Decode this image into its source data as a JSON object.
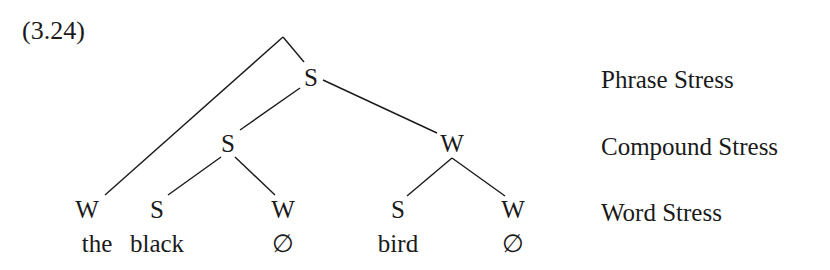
{
  "example_number": "(3.24)",
  "tree": {
    "nodes": [
      {
        "id": "apex",
        "label": "",
        "x": 283,
        "y": 37
      },
      {
        "id": "phrase-s",
        "label": "S",
        "x": 311,
        "y": 77
      },
      {
        "id": "compound-s",
        "label": "S",
        "x": 228,
        "y": 143
      },
      {
        "id": "compound-w",
        "label": "W",
        "x": 452,
        "y": 143
      },
      {
        "id": "word-w-the",
        "label": "W",
        "x": 87,
        "y": 209
      },
      {
        "id": "word-s-black",
        "label": "S",
        "x": 157,
        "y": 209
      },
      {
        "id": "word-w-null1",
        "label": "W",
        "x": 283,
        "y": 209
      },
      {
        "id": "word-s-bird",
        "label": "S",
        "x": 398,
        "y": 209
      },
      {
        "id": "word-w-null2",
        "label": "W",
        "x": 513,
        "y": 209
      }
    ],
    "edges": [
      {
        "x1": 283,
        "y1": 37,
        "x2": 105,
        "y2": 195
      },
      {
        "x1": 283,
        "y1": 37,
        "x2": 304,
        "y2": 62
      },
      {
        "x1": 300,
        "y1": 88,
        "x2": 240,
        "y2": 130
      },
      {
        "x1": 323,
        "y1": 80,
        "x2": 437,
        "y2": 133
      },
      {
        "x1": 221,
        "y1": 157,
        "x2": 168,
        "y2": 195
      },
      {
        "x1": 235,
        "y1": 157,
        "x2": 275,
        "y2": 195
      },
      {
        "x1": 452,
        "y1": 158,
        "x2": 407,
        "y2": 196
      },
      {
        "x1": 452,
        "y1": 158,
        "x2": 505,
        "y2": 196
      }
    ]
  },
  "words": [
    {
      "text": "the",
      "x": 97,
      "y": 243
    },
    {
      "text": "black",
      "x": 157,
      "y": 243
    },
    {
      "text": "∅",
      "x": 283,
      "y": 243
    },
    {
      "text": "bird",
      "x": 398,
      "y": 243
    },
    {
      "text": "∅",
      "x": 513,
      "y": 243
    }
  ],
  "levels": [
    {
      "label": "Phrase Stress",
      "y": 79
    },
    {
      "label": "Compound Stress",
      "y": 146
    },
    {
      "label": "Word Stress",
      "y": 212
    }
  ],
  "colors": {
    "ink": "#1a1a1a",
    "background": "#ffffff"
  }
}
